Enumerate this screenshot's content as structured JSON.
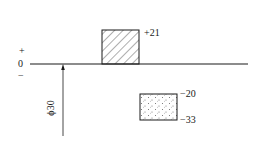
{
  "diagram": {
    "type": "tolerance-zone-diagram",
    "zero_line": {
      "plus_sign": "+",
      "zero_label": "0",
      "minus_sign": "−"
    },
    "nominal_size_label": "ϕ30",
    "hole_zone": {
      "pattern": "hatched",
      "upper_deviation": "+21",
      "lower_deviation": "0"
    },
    "shaft_zone": {
      "pattern": "dotted",
      "upper_deviation": "−20",
      "lower_deviation": "−33"
    },
    "colors": {
      "line": "#1a1a1a",
      "background": "#ffffff"
    }
  }
}
